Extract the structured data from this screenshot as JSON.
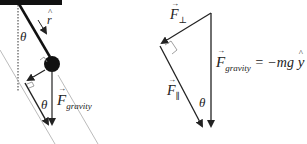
{
  "left_diagram": {
    "theta_top": "θ",
    "r_hat": "r",
    "theta_bottom": "θ",
    "f_gravity_symbol": "F",
    "f_gravity_subscript": "gravity"
  },
  "right_diagram": {
    "f_perp_symbol": "F",
    "f_perp_subscript": "⊥",
    "f_par_symbol": "F",
    "f_par_subscript": "∥",
    "theta": "θ",
    "equation_lhs_symbol": "F",
    "equation_lhs_subscript": "gravity",
    "equation_rhs": "= −mg",
    "y_hat": "y"
  },
  "colors": {
    "ink": "#222222",
    "ceiling": "#111111",
    "guide": "#999999"
  }
}
